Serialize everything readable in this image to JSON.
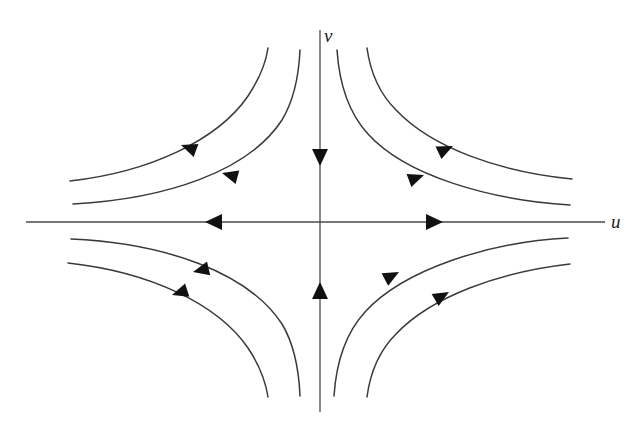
{
  "figure": {
    "kind": "phase-portrait",
    "background_color": "#ffffff",
    "axis_color": "#4a4a4a",
    "curve_color": "#3a3a3a",
    "arrow_color": "#111111",
    "origin": {
      "x": 320,
      "y": 222
    },
    "top_cropped_artifact": "v"
  },
  "labels": {
    "v_axis": "v",
    "u_axis": "u"
  },
  "chart_data": {
    "type": "line",
    "title": "",
    "subtitle": "",
    "xlabel": "u",
    "ylabel": "v",
    "grid": false,
    "legend": null,
    "annotations": [
      "saddle point at origin",
      "u-axis is the unstable manifold (arrows point outward)",
      "v-axis is the stable manifold (arrows point inward toward origin)"
    ],
    "axes": {
      "u_axis": {
        "label": "u",
        "line": {
          "x1": 26,
          "y1": 222,
          "x2": 605,
          "y2": 222
        },
        "label_position": {
          "x": 611,
          "y": 212
        },
        "direction_arrows": [
          {
            "name": "u-negative-arrow",
            "tip": {
              "x": 205,
              "y": 222
            },
            "points": "left",
            "meaning": "flow away from origin"
          },
          {
            "name": "u-positive-arrow",
            "tip": {
              "x": 443,
              "y": 222
            },
            "points": "right",
            "meaning": "flow away from origin"
          }
        ]
      },
      "v_axis": {
        "label": "v",
        "line": {
          "x1": 320,
          "y1": 30,
          "x2": 320,
          "y2": 412
        },
        "label_position": {
          "x": 324,
          "y": 26
        },
        "direction_arrows": [
          {
            "name": "v-positive-arrow",
            "tip": {
              "x": 320,
              "y": 166
            },
            "points": "down",
            "meaning": "flow toward origin"
          },
          {
            "name": "v-negative-arrow",
            "tip": {
              "x": 320,
              "y": 282
            },
            "points": "up",
            "meaning": "flow toward origin"
          }
        ]
      }
    },
    "series": [
      {
        "name": "upper-left-outer",
        "quadrant": "upper-left",
        "path": "M 70 181 C 150 172, 218 140, 248 96 C 260 78, 266 62, 268 48",
        "arrow": {
          "tip": {
            "x": 181,
            "y": 145
          },
          "angle_deg": 200
        }
      },
      {
        "name": "upper-left-inner",
        "quadrant": "upper-left",
        "path": "M 73 204 C 165 199, 248 172, 282 120 C 294 100, 299 72, 300 50",
        "arrow": {
          "tip": {
            "x": 222,
            "y": 173
          },
          "angle_deg": 195
        }
      },
      {
        "name": "upper-right-inner",
        "quadrant": "upper-right",
        "path": "M 337 50 C 339 80, 346 110, 368 134 C 406 176, 490 200, 570 205",
        "arrow": {
          "tip": {
            "x": 424,
            "y": 175
          },
          "angle_deg": 340
        }
      },
      {
        "name": "upper-right-outer",
        "quadrant": "upper-right",
        "path": "M 367 48 C 370 70, 378 92, 396 110 C 432 148, 500 172, 572 179",
        "arrow": {
          "tip": {
            "x": 453,
            "y": 146
          },
          "angle_deg": 335
        }
      },
      {
        "name": "lower-left-inner",
        "quadrant": "lower-left",
        "path": "M 71 239 C 164 243, 248 272, 282 324 C 294 344, 299 372, 300 396",
        "arrow": {
          "tip": {
            "x": 193,
            "y": 272
          },
          "angle_deg": 167
        }
      },
      {
        "name": "lower-left-outer",
        "quadrant": "lower-left",
        "path": "M 68 263 C 150 272, 218 304, 248 348 C 260 366, 266 384, 268 397",
        "arrow": {
          "tip": {
            "x": 172,
            "y": 295
          },
          "angle_deg": 162
        }
      },
      {
        "name": "lower-right-inner",
        "quadrant": "lower-right",
        "path": "M 334 396 C 336 366, 343 336, 365 312 C 403 270, 488 242, 568 238",
        "arrow": {
          "tip": {
            "x": 399,
            "y": 272
          },
          "angle_deg": 332
        }
      },
      {
        "name": "lower-right-outer",
        "quadrant": "lower-right",
        "path": "M 367 397 C 370 374, 378 352, 396 334 C 432 296, 500 272, 570 264",
        "arrow": {
          "tip": {
            "x": 449,
            "y": 292
          },
          "angle_deg": 330
        }
      }
    ]
  }
}
